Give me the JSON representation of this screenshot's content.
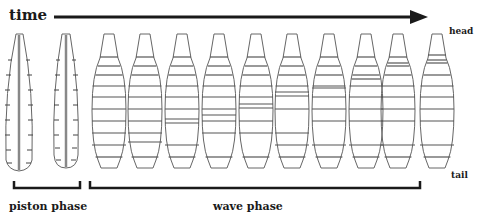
{
  "labels": {
    "time": "time",
    "head": "head",
    "tail": "tail",
    "piston_phase": "piston phase",
    "wave_phase": "wave phase"
  },
  "colors": {
    "outline": "#666666",
    "axis": "#1a1a1a",
    "gut": "#888888"
  },
  "larvae": [
    {
      "phase": "piston",
      "center_x": 19
    },
    {
      "phase": "piston",
      "center_x": 66
    },
    {
      "phase": "wave",
      "center_x": 109
    },
    {
      "phase": "wave",
      "center_x": 145
    },
    {
      "phase": "wave",
      "center_x": 182
    },
    {
      "phase": "wave",
      "center_x": 219
    },
    {
      "phase": "wave",
      "center_x": 256
    },
    {
      "phase": "wave",
      "center_x": 292
    },
    {
      "phase": "wave",
      "center_x": 329
    },
    {
      "phase": "wave",
      "center_x": 366
    },
    {
      "phase": "wave",
      "center_x": 398
    },
    {
      "phase": "wave",
      "center_x": 437
    }
  ]
}
